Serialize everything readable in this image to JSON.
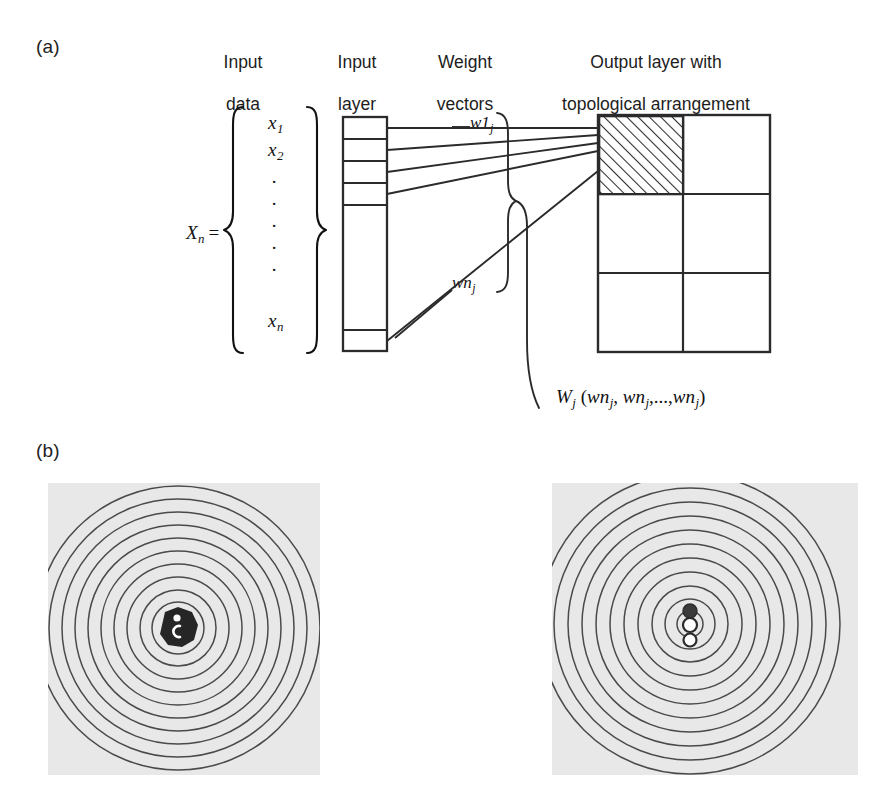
{
  "figure": {
    "panel_a_label": "(a)",
    "panel_b_label": "(b)",
    "column_headings": [
      {
        "name": "input-data",
        "line1": "Input",
        "line2": "data"
      },
      {
        "name": "input-layer",
        "line1": "Input",
        "line2": "layer"
      },
      {
        "name": "weight-vectors",
        "line1": "Weight",
        "line2": "vectors"
      },
      {
        "name": "output-layer",
        "line1": "Output layer with",
        "line2": "topological arrangement"
      }
    ],
    "input_vector": {
      "label_base": "X",
      "label_sub": "n",
      "equals": "=",
      "entries": [
        {
          "base": "x",
          "sub": "1"
        },
        {
          "base": "x",
          "sub": "2"
        },
        {
          "base": "x",
          "sub": "n"
        }
      ],
      "ellipsis_dots": 5
    },
    "input_layer": {
      "cells_top": 4,
      "ellipsis_dots": 5,
      "cells_bottom": 1
    },
    "weight_labels": [
      {
        "name": "w1j",
        "base": "w1",
        "sub": "j"
      },
      {
        "name": "wnj",
        "base": "wn",
        "sub": "j"
      }
    ],
    "weight_vector_formula": {
      "W": "W",
      "W_sub": "j",
      "open": " (",
      "terms": [
        "wn",
        "wn",
        "wn"
      ],
      "term_sub": "j",
      "separator": ", ",
      "ellipsis": ",...,",
      "close": ")"
    },
    "output_grid": {
      "columns": 2,
      "rows": 3,
      "highlighted_cell": {
        "row": 0,
        "col": 0,
        "fill": "diagonal-hatch"
      }
    },
    "maps": [
      {
        "name": "som-map-left",
        "rings": 11,
        "markers": [
          {
            "kind": "dark-blob",
            "shape": "filled-polygon"
          },
          {
            "kind": "white-dot",
            "shape": "small-filled"
          },
          {
            "kind": "white-arc",
            "shape": "c-arc"
          }
        ]
      },
      {
        "name": "som-map-right",
        "rings": 11,
        "markers": [
          {
            "kind": "filled-circle",
            "shape": "filled"
          },
          {
            "kind": "hollow-circle",
            "shape": "outline"
          },
          {
            "kind": "hollow-circle",
            "shape": "outline"
          }
        ]
      }
    ],
    "colors": {
      "panel_background": "#e8e8e8",
      "stroke": "#2b2b2b",
      "hatch": "#2b2b2b",
      "page_background": "#ffffff",
      "marker_dark": "#3b3b3b"
    }
  }
}
